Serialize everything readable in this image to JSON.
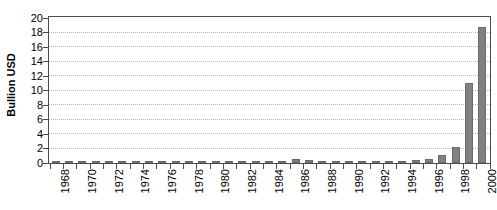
{
  "chart_data": {
    "type": "bar",
    "title": "",
    "subtitle": "",
    "xlabel": "",
    "ylabel": "Bullion USD",
    "ylim": [
      0,
      20
    ],
    "ytick_step": 2,
    "yticks": [
      0,
      2,
      4,
      6,
      8,
      10,
      12,
      14,
      16,
      18,
      20
    ],
    "ytick_labels": [
      "0",
      "2",
      "4",
      "6",
      "8",
      "10",
      "12",
      "14",
      "16",
      "18",
      "20"
    ],
    "grid": true,
    "grid_style": "dotted",
    "legend": false,
    "legend_position": "none",
    "xtick_labels": [
      "1968",
      "1970",
      "1972",
      "1974",
      "1976",
      "1978",
      "1980",
      "1982",
      "1984",
      "1986",
      "1988",
      "1990",
      "1992",
      "1994",
      "1996",
      "1998",
      "2000"
    ],
    "xtick_interval_years": 2,
    "bar_color": "#808080",
    "categories": [
      "1968",
      "1969",
      "1970",
      "1971",
      "1972",
      "1973",
      "1974",
      "1975",
      "1976",
      "1977",
      "1978",
      "1979",
      "1980",
      "1981",
      "1982",
      "1983",
      "1984",
      "1985",
      "1986",
      "1987",
      "1988",
      "1989",
      "1990",
      "1991",
      "1992",
      "1993",
      "1994",
      "1995",
      "1996",
      "1997",
      "1998",
      "1999",
      "2000"
    ],
    "values": [
      0.0,
      0.0,
      0.0,
      0.0,
      0.0,
      0.0,
      0.0,
      0.0,
      0.0,
      0.0,
      0.05,
      0.15,
      0.2,
      0.15,
      0.2,
      0.25,
      0.3,
      0.3,
      0.55,
      0.45,
      0.3,
      0.3,
      0.3,
      0.25,
      0.2,
      0.25,
      0.25,
      0.35,
      0.5,
      1.1,
      2.2,
      11.1,
      18.8
    ],
    "series_name": "Bullion USD"
  },
  "axes": {
    "y_title": "Bullion USD"
  }
}
